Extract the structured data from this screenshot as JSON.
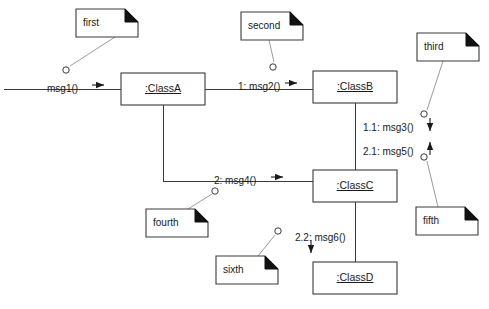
{
  "diagram": {
    "type": "uml-communication-diagram",
    "background_color": "#ffffff",
    "stroke_color": "#3a3a3a",
    "text_color": "#1a1a1a",
    "note_fold_color": "#111111"
  },
  "lifelines": [
    {
      "id": "classA",
      "label": ":ClassA",
      "x": 121,
      "y": 73,
      "w": 84,
      "h": 32
    },
    {
      "id": "classB",
      "label": ":ClassB",
      "x": 313,
      "y": 71,
      "w": 84,
      "h": 32
    },
    {
      "id": "classC",
      "label": ":ClassC",
      "x": 313,
      "y": 170,
      "w": 84,
      "h": 32
    },
    {
      "id": "classD",
      "label": ":ClassD",
      "x": 313,
      "y": 262,
      "w": 84,
      "h": 32
    }
  ],
  "notes": [
    {
      "id": "first",
      "label": "first",
      "x": 76,
      "y": 9,
      "w": 62,
      "h": 28
    },
    {
      "id": "second",
      "label": "second",
      "x": 241,
      "y": 12,
      "w": 62,
      "h": 28
    },
    {
      "id": "third",
      "label": "third",
      "x": 417,
      "y": 33,
      "w": 62,
      "h": 28
    },
    {
      "id": "fourth",
      "label": "fourth",
      "x": 146,
      "y": 209,
      "w": 62,
      "h": 28
    },
    {
      "id": "fifth",
      "label": "fifth",
      "x": 416,
      "y": 207,
      "w": 62,
      "h": 28
    },
    {
      "id": "sixth",
      "label": "sixth",
      "x": 216,
      "y": 256,
      "w": 62,
      "h": 28
    }
  ],
  "messages": [
    {
      "id": "msg1",
      "label": "msg1()",
      "x": 47,
      "y": 84,
      "arrow": "right"
    },
    {
      "id": "msg2",
      "label": "1: msg2()",
      "x": 238,
      "y": 82,
      "arrow": "right"
    },
    {
      "id": "msg3",
      "label": "1.1: msg3()",
      "x": 363,
      "y": 123,
      "arrow": "down"
    },
    {
      "id": "msg5",
      "label": "2.1: msg5()",
      "x": 363,
      "y": 147,
      "arrow": "up"
    },
    {
      "id": "msg4",
      "label": "2: msg4()",
      "x": 214,
      "y": 176,
      "arrow": "right"
    },
    {
      "id": "msg6",
      "label": "2.2: msg6()",
      "x": 295,
      "y": 233,
      "arrow": "down"
    }
  ],
  "anchors": [
    {
      "id": "anchor-first",
      "cx": 66,
      "cy": 70
    },
    {
      "id": "anchor-second",
      "cx": 273,
      "cy": 67
    },
    {
      "id": "anchor-third",
      "cx": 424,
      "cy": 114
    },
    {
      "id": "anchor-fourth",
      "cx": 215,
      "cy": 191
    },
    {
      "id": "anchor-fifth",
      "cx": 424,
      "cy": 157
    },
    {
      "id": "anchor-sixth",
      "cx": 278,
      "cy": 231
    }
  ]
}
